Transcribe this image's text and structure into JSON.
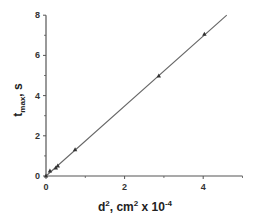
{
  "chart_data": {
    "type": "scatter",
    "title": "",
    "xlabel": "d², cm² x 10⁻⁴",
    "ylabel": "t_max, s",
    "xlabel_parts": {
      "base": "d",
      "sup1": "2",
      "mid": ", cm",
      "sup2": "2",
      "tail": "  x 10",
      "sup3": "-4"
    },
    "ylabel_parts": {
      "base": "t",
      "sub": "max",
      "tail": ", s"
    },
    "xlim": [
      0,
      5
    ],
    "ylim": [
      0,
      8
    ],
    "x_ticks": [
      0,
      2,
      4
    ],
    "x_tick_labels": [
      "0",
      "2",
      "4"
    ],
    "x_minor_ticks": [
      1,
      3,
      5
    ],
    "y_ticks": [
      0,
      2,
      4,
      6,
      8
    ],
    "y_tick_labels": [
      "0",
      "2",
      "4",
      "6",
      "8"
    ],
    "y_minor_ticks": [
      1,
      3,
      5,
      7
    ],
    "grid": false,
    "legend": null,
    "series": [
      {
        "name": "measured",
        "marker": "triangle",
        "x": [
          0.0,
          0.1,
          0.25,
          0.3,
          0.74,
          2.87,
          4.03
        ],
        "y": [
          0.0,
          0.25,
          0.4,
          0.5,
          1.3,
          4.97,
          7.05
        ]
      },
      {
        "name": "linear fit",
        "line": true,
        "x": [
          0.0,
          4.6
        ],
        "y": [
          0.0,
          8.0
        ]
      }
    ]
  }
}
